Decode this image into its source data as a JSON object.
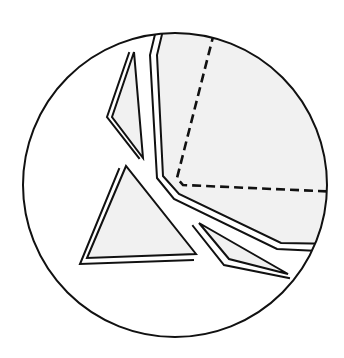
{
  "diagram": {
    "title": "",
    "colors": {
      "stroke": "#111111",
      "fragment_fill": "#f1f1f1",
      "background": "#ffffff"
    },
    "circle": {
      "cx": 175,
      "cy": 185,
      "r": 152
    },
    "labels": []
  }
}
